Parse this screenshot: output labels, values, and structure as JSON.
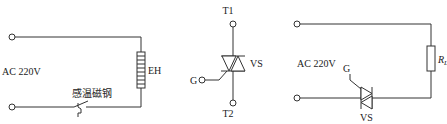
{
  "diagrams": [
    {
      "id": "heater-circuit",
      "supply_label": "AC  220V",
      "heater_label": "EH",
      "switch_label": "感温磁钢"
    },
    {
      "id": "triac-symbol",
      "terminal_top": "T1",
      "terminal_bottom": "T2",
      "gate_label": "G",
      "device_label": "VS"
    },
    {
      "id": "triac-load-circuit",
      "supply_label": "AC  220V",
      "load_label": "R",
      "load_subscript": "L",
      "gate_label": "G",
      "device_label": "VS"
    }
  ],
  "colors": {
    "line": "#333333",
    "background": "#ffffff"
  }
}
